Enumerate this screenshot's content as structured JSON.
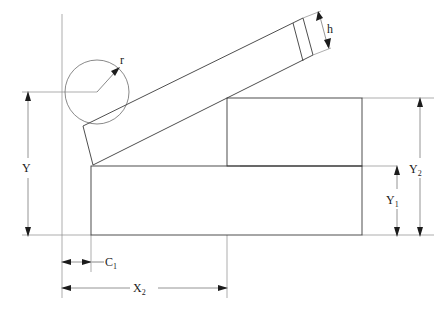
{
  "drawing": {
    "title": "Inclined bar and block dimensioned engineering drawing",
    "background_color": "#ffffff",
    "line_color": "#3a3a3a",
    "dimension_line_color": "#7a7a7a",
    "text_color": "#1a1a1a"
  },
  "labels": {
    "radius": {
      "base": "r",
      "sub": ""
    },
    "height": {
      "base": "h",
      "sub": ""
    },
    "y": {
      "base": "Y",
      "sub": ""
    },
    "y1": {
      "base": "Y",
      "sub": "1"
    },
    "y2": {
      "base": "Y",
      "sub": "2"
    },
    "c1": {
      "base": "C",
      "sub": "1"
    },
    "x2": {
      "base": "X",
      "sub": "2"
    }
  },
  "geometry": {
    "circle": {
      "cx": 97,
      "cy": 92,
      "r": 32
    },
    "radius_arrow": {
      "x1": 97,
      "y1": 92,
      "x2": 118,
      "y2": 69
    },
    "lower_rect": {
      "x": 91,
      "y": 166,
      "width": 271,
      "height": 69
    },
    "upper_rect": {
      "x": 227,
      "y": 98,
      "width": 135,
      "height": 68
    },
    "bar": {
      "angle_deg": -28,
      "corner_bl": [
        93,
        165
      ],
      "corner_tl": [
        83,
        126
      ],
      "corner_tr": [
        303,
        18
      ],
      "corner_br": [
        313,
        55
      ],
      "divider": [
        [
          293,
          23
        ],
        [
          303,
          61
        ]
      ]
    }
  },
  "dimensions": [
    {
      "name": "Y",
      "axis": "vertical",
      "from": 93,
      "to": 235,
      "at": 28,
      "label_at": 168
    },
    {
      "name": "Y2",
      "axis": "vertical",
      "from": 98,
      "to": 235,
      "at": 420,
      "label_at": 169
    },
    {
      "name": "Y1",
      "axis": "vertical",
      "from": 166,
      "to": 235,
      "at": 397,
      "label_at": 199
    },
    {
      "name": "C1",
      "axis": "horizontal",
      "from": 62,
      "to": 91,
      "at": 262,
      "label_at": 110
    },
    {
      "name": "X2",
      "axis": "horizontal",
      "from": 62,
      "to": 227,
      "at": 288,
      "label_at": 145
    }
  ]
}
